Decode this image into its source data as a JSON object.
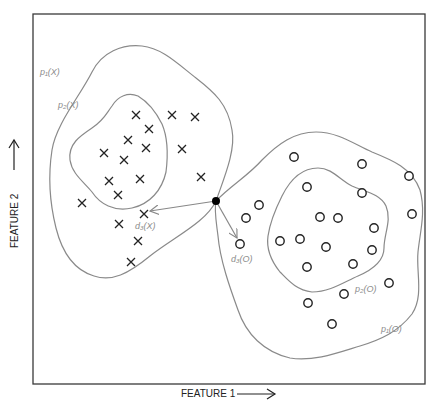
{
  "diagram": {
    "type": "scatter-classification",
    "frame": {
      "x0": 33,
      "y0": 14,
      "x1": 425,
      "y1": 384
    },
    "axes": {
      "x_label": "FEATURE 1",
      "y_label": "FEATURE 2"
    },
    "query_point": {
      "x": 216,
      "y": 201,
      "color": "#000000"
    },
    "classes": {
      "X": {
        "marker": "cross",
        "points": [
          [
            136,
            115
          ],
          [
            172,
            115
          ],
          [
            195,
            117
          ],
          [
            149,
            129
          ],
          [
            128,
            140
          ],
          [
            146,
            148
          ],
          [
            182,
            149
          ],
          [
            104,
            153
          ],
          [
            124,
            160
          ],
          [
            109,
            181
          ],
          [
            140,
            179
          ],
          [
            201,
            177
          ],
          [
            118,
            195
          ],
          [
            82,
            203
          ],
          [
            144,
            214
          ],
          [
            119,
            224
          ],
          [
            138,
            241
          ],
          [
            131,
            262
          ]
        ],
        "contours": [
          {
            "label": "p₁(X)",
            "label_pos": [
              38,
              72
            ]
          },
          {
            "label": "p₂(X)",
            "label_pos": [
              58,
              106
            ]
          }
        ],
        "distance": {
          "label": "d₃(X)",
          "target": [
            144,
            214
          ],
          "label_pos": [
            135,
            228
          ]
        }
      },
      "O": {
        "marker": "circle",
        "points": [
          [
            294,
            157
          ],
          [
            362,
            164
          ],
          [
            409,
            176
          ],
          [
            307,
            187
          ],
          [
            362,
            193
          ],
          [
            259,
            205
          ],
          [
            246,
            218
          ],
          [
            412,
            214
          ],
          [
            320,
            217
          ],
          [
            338,
            218
          ],
          [
            374,
            228
          ],
          [
            280,
            241
          ],
          [
            300,
            239
          ],
          [
            326,
            247
          ],
          [
            372,
            250
          ],
          [
            240,
            244
          ],
          [
            307,
            267
          ],
          [
            353,
            264
          ],
          [
            389,
            283
          ],
          [
            344,
            294
          ],
          [
            308,
            303
          ],
          [
            332,
            324
          ]
        ],
        "contours": [
          {
            "label": "p₂(O)",
            "label_pos": [
              355,
              290
            ]
          },
          {
            "label": "p₁(O)",
            "label_pos": [
              380,
              331
            ]
          }
        ],
        "distance": {
          "label": "d₃(O)",
          "target": [
            240,
            244
          ],
          "label_pos": [
            231,
            261
          ]
        }
      }
    },
    "colors": {
      "markers": "#222222",
      "contours": "#8a8a8a",
      "labels": "#8c8c8c"
    }
  }
}
